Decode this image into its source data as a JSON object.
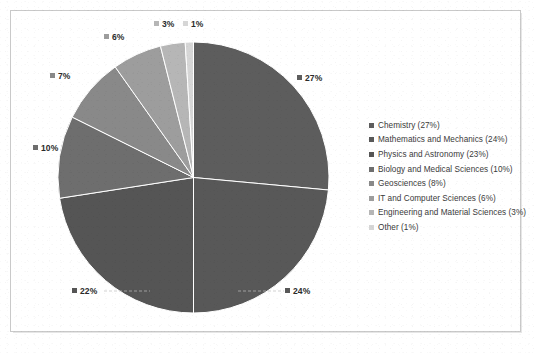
{
  "chart_data": {
    "type": "pie",
    "title": "",
    "subtitle": "",
    "xlabel": "",
    "ylabel": "",
    "grid": false,
    "legend_position": "right",
    "start_angle_deg": 0,
    "direction": "clockwise",
    "categories": [
      "Chemistry",
      "Mathematics and Mechanics",
      "Physics and Astronomy",
      "Biology and Medical Sciences",
      "Geosciences",
      "IT and Computer Sciences",
      "Engineering and Material Sciences",
      "Other"
    ],
    "values": [
      27,
      24,
      23,
      10,
      8,
      6,
      3,
      1
    ],
    "value_labels": [
      "27%",
      "24%",
      "22%",
      "10%",
      "7%",
      "6%",
      "3%",
      "1%"
    ],
    "legend_entries": [
      "Chemistry (27%)",
      "Mathematics and Mechanics (24%)",
      "Physics and Astronomy (23%)",
      "Biology and Medical Sciences (10%)",
      "Geosciences (8%)",
      "IT and Computer Sciences (6%)",
      "Engineering and Material Sciences (3%)",
      "Other (1%)"
    ],
    "colors": [
      "#5d5d5d",
      "#585858",
      "#555555",
      "#6e6e6e",
      "#898989",
      "#9d9d9d",
      "#b6b6b6",
      "#d6d6d6"
    ],
    "slice_border_color": "#ffffff",
    "label_text_color": "#2b2b2b",
    "legend_text_color": "#3a3a3a",
    "frame_color": "#c9c9c9",
    "background": "#ffffff"
  },
  "labels": [
    {
      "text": "27%",
      "color": "#5d5d5d",
      "left": 297,
      "top": 73
    },
    {
      "text": "24%",
      "color": "#585858",
      "left": 285,
      "top": 286
    },
    {
      "text": "22%",
      "color": "#555555",
      "left": 72,
      "top": 286
    },
    {
      "text": "10%",
      "color": "#6e6e6e",
      "left": 33,
      "top": 143
    },
    {
      "text": "7%",
      "color": "#898989",
      "left": 50,
      "top": 71
    },
    {
      "text": "6%",
      "color": "#9d9d9d",
      "left": 104,
      "top": 32
    },
    {
      "text": "3%",
      "color": "#b6b6b6",
      "left": 154,
      "top": 19
    },
    {
      "text": "1%",
      "color": "#d6d6d6",
      "left": 183,
      "top": 19
    }
  ]
}
